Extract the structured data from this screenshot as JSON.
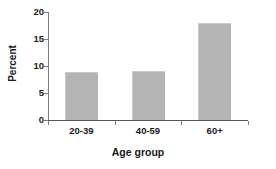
{
  "chart_data": {
    "type": "bar",
    "title": "",
    "subtitle": "",
    "xlabel": "Age group",
    "ylabel": "Percent",
    "categories": [
      "20-39",
      "40-59",
      "60+"
    ],
    "values": [
      8.8,
      9.0,
      18.0
    ],
    "series": [
      {
        "name": "Percent",
        "values": [
          8.8,
          9.0,
          18.0
        ]
      }
    ],
    "ylim": [
      0,
      20
    ],
    "yticks": [
      0,
      5,
      10,
      15,
      20
    ],
    "ytick_labels": [
      "0",
      "5",
      "10",
      "15",
      "20"
    ],
    "grid": false,
    "legend": false,
    "legend_position": "none",
    "bar_color": "#b4b4b4",
    "axis_color": "#7f7f7f",
    "text_color": "#1a1a1a",
    "background": "#ffffff"
  }
}
